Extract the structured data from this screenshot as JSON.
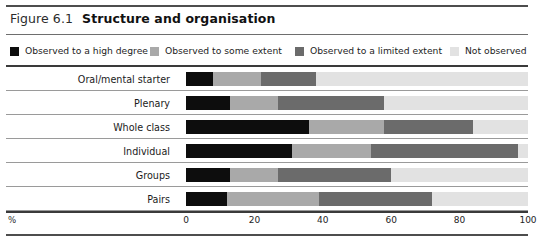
{
  "figure": {
    "number": "Figure 6.1",
    "title": "Structure and organisation"
  },
  "axis": {
    "percent_symbol": "%",
    "ticks": [
      "0",
      "20",
      "40",
      "60",
      "80",
      "100"
    ]
  },
  "colors": {
    "high_degree": "#0d0d0d",
    "some_extent": "#a9a9a9",
    "limited_extent": "#6b6b6b",
    "not_observed": "#e2e2e2",
    "rule_dark": "#4d4d4d",
    "rule_light": "#9a9a9a",
    "text": "#1a1a1a"
  },
  "legend": {
    "items": [
      {
        "label": "Observed to a high degree",
        "color": "#0d0d0d",
        "swatch_name": "legend-swatch-high-degree"
      },
      {
        "label": "Observed to some extent",
        "color": "#a9a9a9",
        "swatch_name": "legend-swatch-some-extent"
      },
      {
        "label": "Observed to a limited extent",
        "color": "#6b6b6b",
        "swatch_name": "legend-swatch-limited-extent"
      },
      {
        "label": "Not observed",
        "color": "#e2e2e2",
        "swatch_name": "legend-swatch-not-observed"
      }
    ]
  },
  "chart_data": {
    "type": "bar",
    "orientation": "horizontal",
    "stacked": true,
    "stack_normalized": true,
    "title": "Structure and organisation",
    "subtitle": "Figure 6.1",
    "xlabel": "%",
    "ylabel": "",
    "xlim": [
      0,
      100
    ],
    "xticks": [
      0,
      20,
      40,
      60,
      80,
      100
    ],
    "grid": false,
    "legend_position": "top",
    "categories": [
      "Oral/mental starter",
      "Plenary",
      "Whole class",
      "Individual",
      "Groups",
      "Pairs"
    ],
    "series": [
      {
        "name": "Observed to a high degree",
        "color": "#0d0d0d",
        "values": [
          8,
          13,
          36,
          31,
          13,
          12
        ]
      },
      {
        "name": "Observed to some extent",
        "color": "#a9a9a9",
        "values": [
          14,
          14,
          22,
          23,
          14,
          27
        ]
      },
      {
        "name": "Observed to a limited extent",
        "color": "#6b6b6b",
        "values": [
          16,
          31,
          26,
          43,
          33,
          33
        ]
      },
      {
        "name": "Not observed",
        "color": "#e2e2e2",
        "values": [
          62,
          42,
          16,
          3,
          40,
          28
        ]
      }
    ],
    "rows": [
      {
        "category": "Oral/mental starter",
        "high_degree": 8,
        "some_extent": 14,
        "limited_extent": 16,
        "not_observed": 62
      },
      {
        "category": "Plenary",
        "high_degree": 13,
        "some_extent": 14,
        "limited_extent": 31,
        "not_observed": 42
      },
      {
        "category": "Whole class",
        "high_degree": 36,
        "some_extent": 22,
        "limited_extent": 26,
        "not_observed": 16
      },
      {
        "category": "Individual",
        "high_degree": 31,
        "some_extent": 23,
        "limited_extent": 43,
        "not_observed": 3
      },
      {
        "category": "Groups",
        "high_degree": 13,
        "some_extent": 14,
        "limited_extent": 33,
        "not_observed": 40
      },
      {
        "category": "Pairs",
        "high_degree": 12,
        "some_extent": 27,
        "limited_extent": 33,
        "not_observed": 28
      }
    ]
  }
}
